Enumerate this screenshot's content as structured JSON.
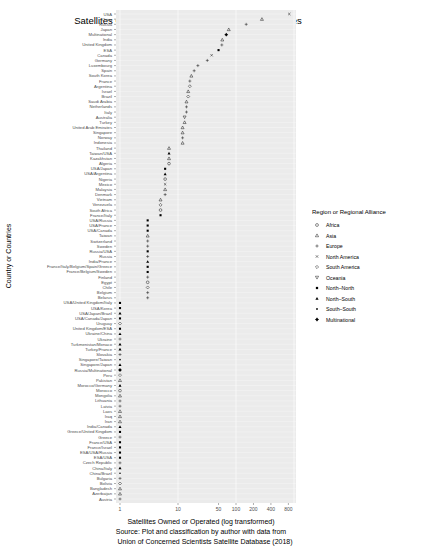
{
  "chart_data": {
    "type": "scatter",
    "title": "Satellites Owned or Operated by Country or Countries",
    "xlabel": "Satellites Owned or Operated (log transformed)",
    "ylabel": "Country or Countries",
    "caption_lines": [
      "Source: Plot and classification by author with data from",
      "Union of Concerned Scientists Satellite Database (2018)"
    ],
    "x_scale": "log10",
    "xlim": [
      1,
      1000
    ],
    "x_ticks": [
      1,
      10,
      50,
      100,
      200,
      400,
      800
    ],
    "grid": true,
    "legend": {
      "title": "Region or Regional Alliance",
      "position": "right",
      "entries": [
        {
          "label": "Africa",
          "shape": "circle-open"
        },
        {
          "label": "Asia",
          "shape": "triangle-open"
        },
        {
          "label": "Europe",
          "shape": "plus"
        },
        {
          "label": "North America",
          "shape": "cross"
        },
        {
          "label": "South America",
          "shape": "diamond-open"
        },
        {
          "label": "Oceania",
          "shape": "triangle-down-open"
        },
        {
          "label": "North–North",
          "shape": "square-filled"
        },
        {
          "label": "North–South",
          "shape": "triangle-filled"
        },
        {
          "label": "South–South",
          "shape": "dot-filled"
        },
        {
          "label": "Multinational",
          "shape": "diamond-plus"
        }
      ]
    },
    "points": [
      {
        "label": "USA",
        "value": 830,
        "group": "North America"
      },
      {
        "label": "China",
        "value": 280,
        "group": "Asia"
      },
      {
        "label": "Russia",
        "value": 150,
        "group": "Europe"
      },
      {
        "label": "Japan",
        "value": 75,
        "group": "Asia"
      },
      {
        "label": "Multinational",
        "value": 68,
        "group": "Multinational"
      },
      {
        "label": "India",
        "value": 58,
        "group": "Asia"
      },
      {
        "label": "United Kingdom",
        "value": 57,
        "group": "Europe"
      },
      {
        "label": "ESA",
        "value": 50,
        "group": "North–North"
      },
      {
        "label": "Canada",
        "value": 38,
        "group": "North America"
      },
      {
        "label": "Germany",
        "value": 32,
        "group": "Europe"
      },
      {
        "label": "Luxembourg",
        "value": 22,
        "group": "Europe"
      },
      {
        "label": "Spain",
        "value": 19,
        "group": "Europe"
      },
      {
        "label": "South Korea",
        "value": 17,
        "group": "Asia"
      },
      {
        "label": "France",
        "value": 16,
        "group": "Europe"
      },
      {
        "label": "Argentina",
        "value": 16,
        "group": "South America"
      },
      {
        "label": "Israel",
        "value": 15,
        "group": "Asia"
      },
      {
        "label": "Brazil",
        "value": 15,
        "group": "South America"
      },
      {
        "label": "Saudi Arabia",
        "value": 14,
        "group": "Asia"
      },
      {
        "label": "Netherlands",
        "value": 14,
        "group": "Europe"
      },
      {
        "label": "Italy",
        "value": 14,
        "group": "Europe"
      },
      {
        "label": "Australia",
        "value": 13,
        "group": "Oceania"
      },
      {
        "label": "Turkey",
        "value": 13,
        "group": "Asia"
      },
      {
        "label": "United Arab Emirates",
        "value": 12,
        "group": "Asia"
      },
      {
        "label": "Singapore",
        "value": 12,
        "group": "Asia"
      },
      {
        "label": "Norway",
        "value": 12,
        "group": "Europe"
      },
      {
        "label": "Indonesia",
        "value": 12,
        "group": "Asia"
      },
      {
        "label": "Thailand",
        "value": 7,
        "group": "Asia"
      },
      {
        "label": "Taiwan/USA",
        "value": 7,
        "group": "North–South"
      },
      {
        "label": "Kazakhstan",
        "value": 7,
        "group": "Asia"
      },
      {
        "label": "Algeria",
        "value": 7,
        "group": "Africa"
      },
      {
        "label": "USA/Japan",
        "value": 6,
        "group": "North–North"
      },
      {
        "label": "USA/Argentina",
        "value": 6,
        "group": "North–South"
      },
      {
        "label": "Nigeria",
        "value": 6,
        "group": "Africa"
      },
      {
        "label": "Mexico",
        "value": 6,
        "group": "North America"
      },
      {
        "label": "Malaysia",
        "value": 6,
        "group": "Asia"
      },
      {
        "label": "Denmark",
        "value": 6,
        "group": "Europe"
      },
      {
        "label": "Vietnam",
        "value": 5,
        "group": "Asia"
      },
      {
        "label": "Venezuela",
        "value": 5,
        "group": "South America"
      },
      {
        "label": "South Africa",
        "value": 5,
        "group": "Africa"
      },
      {
        "label": "France/Italy",
        "value": 5,
        "group": "North–North"
      },
      {
        "label": "USA/Russia",
        "value": 3,
        "group": "North–North"
      },
      {
        "label": "USA/France",
        "value": 3,
        "group": "North–North"
      },
      {
        "label": "USA/Canada",
        "value": 3,
        "group": "North–North"
      },
      {
        "label": "Taiwan",
        "value": 3,
        "group": "Asia"
      },
      {
        "label": "Switzerland",
        "value": 3,
        "group": "Europe"
      },
      {
        "label": "Sweden",
        "value": 3,
        "group": "Europe"
      },
      {
        "label": "Russia/USA",
        "value": 3,
        "group": "North–North"
      },
      {
        "label": "Russia",
        "value": 3,
        "group": "Europe"
      },
      {
        "label": "India/France",
        "value": 3,
        "group": "North–South"
      },
      {
        "label": "France/Italy/Belgium/Spain/Greece",
        "value": 3,
        "group": "North–North"
      },
      {
        "label": "France/Belgium/Sweden",
        "value": 3,
        "group": "North–North"
      },
      {
        "label": "Finland",
        "value": 3,
        "group": "Europe"
      },
      {
        "label": "Egypt",
        "value": 3,
        "group": "Africa"
      },
      {
        "label": "Chile",
        "value": 3,
        "group": "South America"
      },
      {
        "label": "Belgium",
        "value": 3,
        "group": "Europe"
      },
      {
        "label": "Belarus",
        "value": 3,
        "group": "Europe"
      },
      {
        "label": "USA/United Kingdom/Italy",
        "value": 1,
        "group": "North–North"
      },
      {
        "label": "USA/Korea",
        "value": 1,
        "group": "North–North"
      },
      {
        "label": "USA/Japan/Brazil",
        "value": 1,
        "group": "North–South"
      },
      {
        "label": "USA/Canada/Japan",
        "value": 1,
        "group": "North–North"
      },
      {
        "label": "Uruguay",
        "value": 1,
        "group": "South America"
      },
      {
        "label": "United Kingdom/ESA",
        "value": 1,
        "group": "North–North"
      },
      {
        "label": "Ukraine/China",
        "value": 1,
        "group": "North–South"
      },
      {
        "label": "Ukraine",
        "value": 1,
        "group": "Europe"
      },
      {
        "label": "Turkmenistan/Monaco",
        "value": 1,
        "group": "North–South"
      },
      {
        "label": "Turkey/France",
        "value": 1,
        "group": "North–South"
      },
      {
        "label": "Slovakia",
        "value": 1,
        "group": "Europe"
      },
      {
        "label": "Singapore/Taiwan",
        "value": 1,
        "group": "South–South"
      },
      {
        "label": "Singapore/Japan",
        "value": 1,
        "group": "North–South"
      },
      {
        "label": "Russia/Multinational",
        "value": 1,
        "group": "Multinational"
      },
      {
        "label": "Peru",
        "value": 1,
        "group": "South America"
      },
      {
        "label": "Pakistan",
        "value": 1,
        "group": "Asia"
      },
      {
        "label": "Morocco/Germany",
        "value": 1,
        "group": "North–South"
      },
      {
        "label": "Morocco",
        "value": 1,
        "group": "Africa"
      },
      {
        "label": "Mongolia",
        "value": 1,
        "group": "Asia"
      },
      {
        "label": "Lithuania",
        "value": 1,
        "group": "Europe"
      },
      {
        "label": "Latvia",
        "value": 1,
        "group": "Europe"
      },
      {
        "label": "Laos",
        "value": 1,
        "group": "Asia"
      },
      {
        "label": "Iraq",
        "value": 1,
        "group": "Asia"
      },
      {
        "label": "Iran",
        "value": 1,
        "group": "Asia"
      },
      {
        "label": "India/Canada",
        "value": 1,
        "group": "North–South"
      },
      {
        "label": "Greece/United Kingdom",
        "value": 1,
        "group": "North–North"
      },
      {
        "label": "Greece",
        "value": 1,
        "group": "Europe"
      },
      {
        "label": "France/USA",
        "value": 1,
        "group": "North–North"
      },
      {
        "label": "France/Israel",
        "value": 1,
        "group": "North–North"
      },
      {
        "label": "ESA/USA/Russia",
        "value": 1,
        "group": "North–North"
      },
      {
        "label": "ESA/USA",
        "value": 1,
        "group": "North–North"
      },
      {
        "label": "Czech Republic",
        "value": 1,
        "group": "Europe"
      },
      {
        "label": "China/Italy",
        "value": 1,
        "group": "North–South"
      },
      {
        "label": "China/Brazil",
        "value": 1,
        "group": "South–South"
      },
      {
        "label": "Bulgaria",
        "value": 1,
        "group": "Europe"
      },
      {
        "label": "Bolivia",
        "value": 1,
        "group": "South America"
      },
      {
        "label": "Bangladesh",
        "value": 1,
        "group": "Asia"
      },
      {
        "label": "Azerbaijan",
        "value": 1,
        "group": "Asia"
      },
      {
        "label": "Austria",
        "value": 1,
        "group": "Europe"
      }
    ]
  },
  "layout": {
    "panel_left": 116,
    "panel_right": 296,
    "panel_top": 10,
    "panel_bottom": 503,
    "x_px_per_decade": 58,
    "panel_bg": "#ebebeb",
    "grid_color": "#ffffff",
    "text_color": "#4d4d4d"
  }
}
